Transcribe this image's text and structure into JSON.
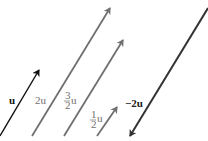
{
  "diagram": {
    "colors": {
      "black": "#111111",
      "gray": "#707070",
      "dark": "#333333"
    },
    "vectors": [
      {
        "id": "u",
        "label": "u",
        "x1": 0,
        "y1": 136,
        "x2": 39,
        "y2": 70,
        "color": "#111111",
        "head": "end"
      },
      {
        "id": "2u",
        "label": "2u",
        "x1": 32,
        "y1": 136,
        "x2": 110,
        "y2": 8,
        "color": "#707070",
        "head": "end"
      },
      {
        "id": "3/2u",
        "label_num": "3",
        "label_den": "2",
        "label_var": "u",
        "x1": 64,
        "y1": 136,
        "x2": 123,
        "y2": 40,
        "color": "#707070",
        "head": "end"
      },
      {
        "id": "1/2u",
        "label_num": "1",
        "label_den": "2",
        "label_var": "u",
        "x1": 97,
        "y1": 136,
        "x2": 117,
        "y2": 107,
        "color": "#707070",
        "head": "end"
      },
      {
        "id": "-2u",
        "label": "−2u",
        "x1": 208,
        "y1": 8,
        "x2": 130,
        "y2": 136,
        "color": "#333333",
        "head": "end"
      }
    ]
  }
}
